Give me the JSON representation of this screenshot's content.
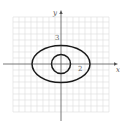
{
  "diagram": {
    "type": "coordinate-plane",
    "axes": {
      "x_label": "x",
      "y_label": "y"
    },
    "tick_labels": {
      "y_tick": "3",
      "x_tick": "2"
    },
    "grid": {
      "visible": true,
      "color": "#d8d8d8"
    },
    "curves": [
      {
        "name": "outer-ellipse",
        "shape": "ellipse",
        "center": [
          0,
          0
        ],
        "semi_axis_x": 5,
        "semi_axis_y": 3,
        "stroke": "#1a1a1a"
      },
      {
        "name": "inner-circle",
        "shape": "circle",
        "center": [
          0,
          0
        ],
        "radius": 1.7,
        "stroke": "#1a1a1a"
      }
    ]
  }
}
